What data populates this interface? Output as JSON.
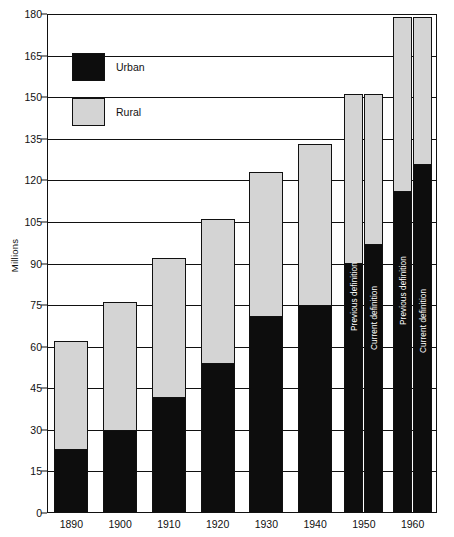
{
  "chart_data": {
    "type": "bar",
    "title": "",
    "subtitle": "",
    "xlabel": "",
    "ylabel": "Millions",
    "ylim": [
      0,
      180
    ],
    "yticks": [
      0,
      15,
      30,
      45,
      60,
      75,
      90,
      105,
      120,
      135,
      150,
      165,
      180
    ],
    "grid": true,
    "stacked": true,
    "legend_position": "top-left",
    "legend": [
      "Urban",
      "Rural"
    ],
    "categories": [
      "1890",
      "1900",
      "1910",
      "1920",
      "1930",
      "1940",
      "1950",
      "1960"
    ],
    "series": [
      {
        "name": "Urban",
        "color": "#0d0d0d",
        "values": [
          23,
          30,
          42,
          54,
          71,
          75,
          90,
          116
        ]
      },
      {
        "name": "Rural",
        "color": "#d4d4d4",
        "values": [
          39,
          46,
          50,
          52,
          52,
          58,
          61,
          63
        ]
      }
    ],
    "totals": [
      62,
      76,
      92,
      106,
      123,
      133,
      151,
      179
    ],
    "bars": [
      {
        "category": "1890",
        "note": "",
        "urban": 23,
        "rural": 39,
        "total": 62
      },
      {
        "category": "1900",
        "note": "",
        "urban": 30,
        "rural": 46,
        "total": 76
      },
      {
        "category": "1910",
        "note": "",
        "urban": 42,
        "rural": 50,
        "total": 92
      },
      {
        "category": "1920",
        "note": "",
        "urban": 54,
        "rural": 52,
        "total": 106
      },
      {
        "category": "1930",
        "note": "",
        "urban": 71,
        "rural": 52,
        "total": 123
      },
      {
        "category": "1940",
        "note": "",
        "urban": 75,
        "rural": 58,
        "total": 133
      },
      {
        "category": "1950",
        "note": "Previous definition",
        "urban": 90,
        "rural": 61,
        "total": 151
      },
      {
        "category": "1950",
        "note": "Current definition",
        "urban": 97,
        "rural": 54,
        "total": 151
      },
      {
        "category": "1960",
        "note": "Previous definition",
        "urban": 116,
        "rural": 63,
        "total": 179
      },
      {
        "category": "1960",
        "note": "Current definition",
        "urban": 126,
        "rural": 53,
        "total": 179
      }
    ],
    "annotations": [
      "Previous definition",
      "Current definition"
    ]
  },
  "axis": {
    "y_title": "Millions",
    "y_ticks": [
      "180",
      "165",
      "150",
      "135",
      "120",
      "105",
      "90",
      "75",
      "60",
      "45",
      "30",
      "15",
      "0"
    ],
    "x_ticks": [
      "1890",
      "1900",
      "1910",
      "1920",
      "1930",
      "1940",
      "1950",
      "1960"
    ]
  },
  "legend": {
    "urban_label": "Urban",
    "rural_label": "Rural",
    "urban_color": "#0d0d0d",
    "rural_color": "#d4d4d4"
  }
}
